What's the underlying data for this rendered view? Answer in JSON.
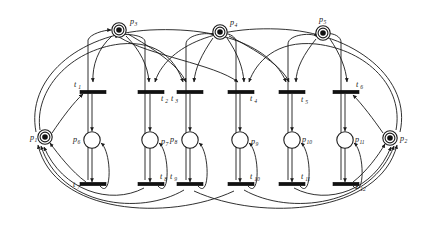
{
  "diagram": {
    "background_color": "#ffffff",
    "stroke_color": "#1a1a1a",
    "token_color": "#111111",
    "width": 428,
    "height": 234
  },
  "places": [
    {
      "id": "p1",
      "label": "p",
      "sub": "1",
      "cx": 45,
      "cy": 137,
      "r": 7.2,
      "tokens": 1,
      "double_ring": true,
      "label_dx": -15,
      "label_dy": 3
    },
    {
      "id": "p2",
      "label": "p",
      "sub": "2",
      "cx": 390,
      "cy": 138,
      "r": 7.2,
      "tokens": 1,
      "double_ring": true,
      "label_dx": 10,
      "label_dy": 3
    },
    {
      "id": "p3",
      "label": "p",
      "sub": "3",
      "cx": 119,
      "cy": 30,
      "r": 7.2,
      "tokens": 1,
      "double_ring": true,
      "label_dx": 11,
      "label_dy": -6
    },
    {
      "id": "p4",
      "label": "p",
      "sub": "4",
      "cx": 220,
      "cy": 32,
      "r": 7.2,
      "tokens": 1,
      "double_ring": true,
      "label_dx": 10,
      "label_dy": -7
    },
    {
      "id": "p5",
      "label": "p",
      "sub": "5",
      "cx": 323,
      "cy": 33,
      "r": 7.2,
      "tokens": 1,
      "double_ring": true,
      "label_dx": -4,
      "label_dy": -11
    },
    {
      "id": "p6",
      "label": "p",
      "sub": "6",
      "cx": 92,
      "cy": 140,
      "r": 8.2,
      "tokens": 0,
      "double_ring": false,
      "label_dx": -19,
      "label_dy": 2
    },
    {
      "id": "p7",
      "label": "p",
      "sub": "7",
      "cx": 150,
      "cy": 140,
      "r": 8.2,
      "tokens": 0,
      "double_ring": false,
      "label_dx": 11,
      "label_dy": 4
    },
    {
      "id": "p8",
      "label": "p",
      "sub": "8",
      "cx": 190,
      "cy": 140,
      "r": 8.2,
      "tokens": 0,
      "double_ring": false,
      "label_dx": -20,
      "label_dy": 2
    },
    {
      "id": "p9",
      "label": "p",
      "sub": "9",
      "cx": 240,
      "cy": 140,
      "r": 8.2,
      "tokens": 0,
      "double_ring": false,
      "label_dx": 11,
      "label_dy": 4
    },
    {
      "id": "p10",
      "label": "p",
      "sub": "10",
      "cx": 292,
      "cy": 140,
      "r": 8.2,
      "tokens": 0,
      "double_ring": false,
      "label_dx": 10,
      "label_dy": 2
    },
    {
      "id": "p11",
      "label": "p",
      "sub": "11",
      "cx": 345,
      "cy": 140,
      "r": 8.2,
      "tokens": 0,
      "double_ring": false,
      "label_dx": 10,
      "label_dy": 2
    }
  ],
  "transitions": [
    {
      "id": "t1",
      "label": "t",
      "sub": "1",
      "cx": 93,
      "cy": 92,
      "w": 26,
      "h": 3.4,
      "label_dx": -19,
      "label_dy": -5
    },
    {
      "id": "t2",
      "label": "t",
      "sub": "2",
      "cx": 151,
      "cy": 92,
      "w": 26,
      "h": 3.4,
      "label_dx": 10,
      "label_dy": 9
    },
    {
      "id": "t3",
      "label": "t",
      "sub": "3",
      "cx": 190,
      "cy": 92,
      "w": 26,
      "h": 3.4,
      "label_dx": -19,
      "label_dy": 9
    },
    {
      "id": "t4",
      "label": "t",
      "sub": "4",
      "cx": 241,
      "cy": 92,
      "w": 26,
      "h": 3.4,
      "label_dx": 9,
      "label_dy": 9
    },
    {
      "id": "t5",
      "label": "t",
      "sub": "5",
      "cx": 292,
      "cy": 92,
      "w": 26,
      "h": 3.4,
      "label_dx": 9,
      "label_dy": 10
    },
    {
      "id": "t6",
      "label": "t",
      "sub": "6",
      "cx": 346,
      "cy": 92,
      "w": 26,
      "h": 3.4,
      "label_dx": 10,
      "label_dy": -5
    },
    {
      "id": "t7",
      "label": "t",
      "sub": "7",
      "cx": 93,
      "cy": 184,
      "w": 26,
      "h": 3.4,
      "label_dx": -20,
      "label_dy": 3
    },
    {
      "id": "t8",
      "label": "t",
      "sub": "8",
      "cx": 151,
      "cy": 184,
      "w": 26,
      "h": 3.4,
      "label_dx": 9,
      "label_dy": -5
    },
    {
      "id": "t9",
      "label": "t",
      "sub": "9",
      "cx": 190,
      "cy": 184,
      "w": 26,
      "h": 3.4,
      "label_dx": -20,
      "label_dy": -5
    },
    {
      "id": "t10",
      "label": "t",
      "sub": "10",
      "cx": 241,
      "cy": 184,
      "w": 26,
      "h": 3.4,
      "label_dx": 9,
      "label_dy": -5
    },
    {
      "id": "t11",
      "label": "t",
      "sub": "11",
      "cx": 292,
      "cy": 184,
      "w": 26,
      "h": 3.4,
      "label_dx": 9,
      "label_dy": -5
    },
    {
      "id": "t12",
      "label": "t",
      "sub": "12",
      "cx": 346,
      "cy": 184,
      "w": 26,
      "h": 3.4,
      "label_dx": 10,
      "label_dy": 5
    }
  ],
  "arcs": [
    {
      "id": "a-t1-p6",
      "d": "M 92 94 L 92 131",
      "arrow": "end"
    },
    {
      "id": "a-t2-p7",
      "d": "M 150 94 L 150 131",
      "arrow": "end"
    },
    {
      "id": "a-t3-p8",
      "d": "M 190 94 L 190 131",
      "arrow": "end"
    },
    {
      "id": "a-t4-p9",
      "d": "M 240 94 L 240 131",
      "arrow": "end"
    },
    {
      "id": "a-t5-p10",
      "d": "M 292 94 L 292 131",
      "arrow": "end"
    },
    {
      "id": "a-t6-p11",
      "d": "M 345 94 L 345 131",
      "arrow": "end"
    },
    {
      "id": "a-p6-t7",
      "d": "M 92 148 L 92 182",
      "arrow": "end"
    },
    {
      "id": "a-p7-t8",
      "d": "M 150 148 L 150 182",
      "arrow": "end"
    },
    {
      "id": "a-p8-t9",
      "d": "M 190 148 L 190 182",
      "arrow": "end"
    },
    {
      "id": "a-p9-t10",
      "d": "M 240 148 L 240 182",
      "arrow": "end"
    },
    {
      "id": "a-p10-t11",
      "d": "M 292 148 L 292 182",
      "arrow": "end"
    },
    {
      "id": "a-p11-t12",
      "d": "M 345 148 L 345 182",
      "arrow": "end"
    },
    {
      "id": "a-t7-p6-loop",
      "d": "M 100 186 C 112 200 112 152 101 143",
      "arrow": "end"
    },
    {
      "id": "a-t8-p7-loop",
      "d": "M 158 186 C 170 200 170 152 159 143",
      "arrow": "end"
    },
    {
      "id": "a-t9-p8-loop",
      "d": "M 198 186 C 210 200 210 152 199 143",
      "arrow": "end"
    },
    {
      "id": "a-t10-p9-loop",
      "d": "M 248 186 C 260 200 260 152 249 143",
      "arrow": "end"
    },
    {
      "id": "a-t11-p10-loop",
      "d": "M 300 186 C 312 200 312 152 301 143",
      "arrow": "end"
    },
    {
      "id": "a-t12-p11-loop",
      "d": "M 353 186 C 365 200 365 152 354 143",
      "arrow": "end"
    },
    {
      "id": "a-p3-t1",
      "d": "M 112 36 C 98 48 92 66 93 82",
      "arrow": "end"
    },
    {
      "id": "a-p3-t2",
      "d": "M 126 36 C 140 50 148 66 149 82",
      "arrow": "end"
    },
    {
      "id": "a-p3-t3b",
      "d": "M 128 34 C 152 48 178 64 186 82",
      "arrow": "end"
    },
    {
      "id": "a-p4-t3",
      "d": "M 213 38 C 202 54 195 68 194 82",
      "arrow": "end"
    },
    {
      "id": "a-p4-t4",
      "d": "M 227 38 C 238 54 243 68 244 82",
      "arrow": "end"
    },
    {
      "id": "a-p4-t5b",
      "d": "M 229 36 C 256 50 282 66 289 82",
      "arrow": "end"
    },
    {
      "id": "a-p5-t5",
      "d": "M 316 39 C 304 54 296 68 296 82",
      "arrow": "end"
    },
    {
      "id": "a-p5-t6",
      "d": "M 330 39 C 340 54 346 68 347 82",
      "arrow": "end"
    },
    {
      "id": "a-p3-t4b",
      "d": "M 119 37 C 150 56 214 64 238 82",
      "arrow": "end"
    },
    {
      "id": "a-t7-p3",
      "d": "M 88 180 L 88 40 C 90 34 104 30 111 30",
      "arrow": "end"
    },
    {
      "id": "a-t8-p3",
      "d": "M 145 180 L 145 42 C 146 34 116 32 116 38",
      "arrow": "end"
    },
    {
      "id": "a-t9-p4",
      "d": "M 186 180 L 186 44 C 186 34 212 31 214 36",
      "arrow": "end"
    },
    {
      "id": "a-t10-p4",
      "d": "M 236 180 L 236 42 C 236 34 220 30 220 38",
      "arrow": "end"
    },
    {
      "id": "a-t11-p5",
      "d": "M 288 180 L 288 44 C 288 34 314 32 317 37",
      "arrow": "end"
    },
    {
      "id": "a-t12-p5",
      "d": "M 341 180 L 341 42 C 341 34 324 30 324 38",
      "arrow": "end"
    },
    {
      "id": "a-p1-t1",
      "d": "M 52 133 C 62 118 74 102 83 94",
      "arrow": "end"
    },
    {
      "id": "a-p1-outer-t3",
      "d": "M 40 130 C 34 90 70 50 120 44 C 160 40 176 62 183 82",
      "arrow": "end"
    },
    {
      "id": "a-p1-outer-t5",
      "d": "M 36 132 C 26 80 76 34 150 30 C 236 26 276 56 286 82",
      "arrow": "end"
    },
    {
      "id": "a-p2-t6",
      "d": "M 383 133 C 374 120 362 104 353 95",
      "arrow": "end"
    },
    {
      "id": "a-p2-outer-t4",
      "d": "M 396 130 C 404 88 368 50 316 44 C 276 40 256 62 249 82",
      "arrow": "end"
    },
    {
      "id": "a-p2-outer-t2",
      "d": "M 400 132 C 412 80 356 32 278 29 C 196 26 162 58 155 82",
      "arrow": "end"
    },
    {
      "id": "a-t7-p1",
      "d": "M 86 182 C 72 172 58 154 50 143",
      "arrow": "end"
    },
    {
      "id": "a-t8-p1",
      "d": "M 144 188 C 110 206 62 190 44 147",
      "arrow": "end"
    },
    {
      "id": "a-t9-p1",
      "d": "M 184 190 C 140 216 60 206 41 146",
      "arrow": "end"
    },
    {
      "id": "a-t10-p1",
      "d": "M 234 191 C 168 222 54 214 38 145",
      "arrow": "end"
    },
    {
      "id": "a-t12-p2",
      "d": "M 353 182 C 366 172 378 156 385 144",
      "arrow": "end"
    },
    {
      "id": "a-t11-p2",
      "d": "M 294 188 C 328 206 374 190 391 147",
      "arrow": "end"
    },
    {
      "id": "a-t10-p2",
      "d": "M 244 190 C 290 216 372 206 394 146",
      "arrow": "end"
    },
    {
      "id": "a-t9-p2",
      "d": "M 194 191 C 262 222 380 214 397 145",
      "arrow": "end"
    }
  ]
}
